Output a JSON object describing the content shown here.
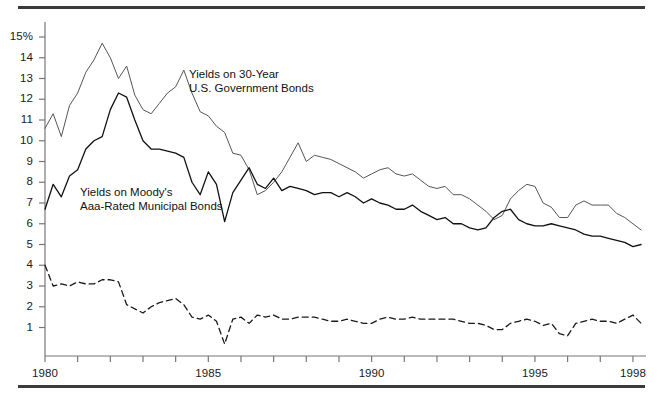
{
  "figure": {
    "background": "#ffffff",
    "top_rule_color": "#3a3a3a",
    "bottom_rule_color": "#3a3a3a"
  },
  "annotations": {
    "gov_line1": "Yields on 30-Year",
    "gov_line2": "U.S. Government Bonds",
    "muni_line1": "Yields on Moody's",
    "muni_line2": "Aaa-Rated Municipal Bonds"
  },
  "chart_data": {
    "type": "line",
    "title": "",
    "subtitle": "",
    "xlabel": "",
    "ylabel": "",
    "xlim": [
      1980.0,
      1998.4
    ],
    "ylim": [
      0,
      15.6
    ],
    "grid": false,
    "legend_position": "inline-annotations",
    "y_ticks": [
      1,
      2,
      3,
      4,
      5,
      6,
      7,
      8,
      9,
      10,
      11,
      12,
      13,
      14,
      15
    ],
    "y_tick_labels": [
      "1",
      "2",
      "3",
      "4",
      "5",
      "6",
      "7",
      "8",
      "9",
      "10",
      "11",
      "12",
      "13",
      "14",
      "15%"
    ],
    "x_ticks": [
      1980,
      1981,
      1982,
      1983,
      1984,
      1985,
      1986,
      1987,
      1988,
      1989,
      1990,
      1991,
      1992,
      1993,
      1994,
      1995,
      1996,
      1997,
      1998
    ],
    "x_tick_labels_shown": [
      "1980",
      "1985",
      "1990",
      "1995",
      "1998"
    ],
    "x_tick_label_values": [
      1980,
      1985,
      1990,
      1995,
      1998
    ],
    "series": [
      {
        "name": "Yields on 30-Year U.S. Government Bonds",
        "style": "solid",
        "color": "#555555",
        "width": 1.0,
        "x": [
          1980.0,
          1980.25,
          1980.5,
          1980.75,
          1981.0,
          1981.25,
          1981.5,
          1981.75,
          1982.0,
          1982.25,
          1982.5,
          1982.75,
          1983.0,
          1983.25,
          1983.5,
          1983.75,
          1984.0,
          1984.25,
          1984.5,
          1984.75,
          1985.0,
          1985.25,
          1985.5,
          1985.75,
          1986.0,
          1986.25,
          1986.5,
          1986.75,
          1987.0,
          1987.25,
          1987.5,
          1987.75,
          1988.0,
          1988.25,
          1988.5,
          1988.75,
          1989.0,
          1989.25,
          1989.5,
          1989.75,
          1990.0,
          1990.25,
          1990.5,
          1990.75,
          1991.0,
          1991.25,
          1991.5,
          1991.75,
          1992.0,
          1992.25,
          1992.5,
          1992.75,
          1993.0,
          1993.25,
          1993.5,
          1993.75,
          1994.0,
          1994.25,
          1994.5,
          1994.75,
          1995.0,
          1995.25,
          1995.5,
          1995.75,
          1996.0,
          1996.25,
          1996.5,
          1996.75,
          1997.0,
          1997.25,
          1997.5,
          1997.75,
          1998.0,
          1998.25
        ],
        "y": [
          10.6,
          11.3,
          10.2,
          11.7,
          12.3,
          13.3,
          13.9,
          14.7,
          14.0,
          13.0,
          13.6,
          12.2,
          11.5,
          11.3,
          11.8,
          12.3,
          12.6,
          13.4,
          12.3,
          11.4,
          11.2,
          10.7,
          10.4,
          9.4,
          9.3,
          8.6,
          7.4,
          7.6,
          8.0,
          8.5,
          9.2,
          9.9,
          9.0,
          9.3,
          9.2,
          9.1,
          8.9,
          8.7,
          8.5,
          8.2,
          8.4,
          8.6,
          8.7,
          8.4,
          8.3,
          8.4,
          8.1,
          7.8,
          7.7,
          7.8,
          7.4,
          7.4,
          7.2,
          6.9,
          6.6,
          6.2,
          6.4,
          7.2,
          7.6,
          7.9,
          7.8,
          7.0,
          6.8,
          6.3,
          6.3,
          6.9,
          7.1,
          6.9,
          6.9,
          6.9,
          6.5,
          6.3,
          6.0,
          5.7
        ],
        "y_right_end": 6.6
      },
      {
        "name": "Yields on Moody's Aaa-Rated Municipal Bonds",
        "style": "solid",
        "color": "#111111",
        "width": 1.3,
        "x": [
          1980.0,
          1980.25,
          1980.5,
          1980.75,
          1981.0,
          1981.25,
          1981.5,
          1981.75,
          1982.0,
          1982.25,
          1982.5,
          1982.75,
          1983.0,
          1983.25,
          1983.5,
          1983.75,
          1984.0,
          1984.25,
          1984.5,
          1984.75,
          1985.0,
          1985.25,
          1985.5,
          1985.75,
          1986.0,
          1986.25,
          1986.5,
          1986.75,
          1987.0,
          1987.25,
          1987.5,
          1987.75,
          1988.0,
          1988.25,
          1988.5,
          1988.75,
          1989.0,
          1989.25,
          1989.5,
          1989.75,
          1990.0,
          1990.25,
          1990.5,
          1990.75,
          1991.0,
          1991.25,
          1991.5,
          1991.75,
          1992.0,
          1992.25,
          1992.5,
          1992.75,
          1993.0,
          1993.25,
          1993.5,
          1993.75,
          1994.0,
          1994.25,
          1994.5,
          1994.75,
          1995.0,
          1995.25,
          1995.5,
          1995.75,
          1996.0,
          1996.25,
          1996.5,
          1996.75,
          1997.0,
          1997.25,
          1997.5,
          1997.75,
          1998.0,
          1998.25
        ],
        "y": [
          6.7,
          7.9,
          7.3,
          8.3,
          8.6,
          9.6,
          10.0,
          10.2,
          11.5,
          12.3,
          12.1,
          11.0,
          10.0,
          9.6,
          9.6,
          9.5,
          9.4,
          9.2,
          8.0,
          7.4,
          8.5,
          7.9,
          6.1,
          7.5,
          8.1,
          8.7,
          7.9,
          7.7,
          8.2,
          7.6,
          7.8,
          7.7,
          7.6,
          7.4,
          7.5,
          7.5,
          7.3,
          7.5,
          7.3,
          7.0,
          7.2,
          7.0,
          6.9,
          6.7,
          6.7,
          6.9,
          6.6,
          6.4,
          6.2,
          6.3,
          6.0,
          6.0,
          5.8,
          5.7,
          5.8,
          6.3,
          6.6,
          6.7,
          6.2,
          6.0,
          5.9,
          5.9,
          6.0,
          5.9,
          5.8,
          5.7,
          5.5,
          5.4,
          5.4,
          5.3,
          5.2,
          5.1,
          4.9,
          5.0
        ],
        "y_right_end": 5.0
      },
      {
        "name": "Spread",
        "style": "dashed",
        "color": "#1a1a1a",
        "width": 1.3,
        "x": [
          1980.0,
          1980.25,
          1980.5,
          1980.75,
          1981.0,
          1981.25,
          1981.5,
          1981.75,
          1982.0,
          1982.25,
          1982.5,
          1982.75,
          1983.0,
          1983.25,
          1983.5,
          1983.75,
          1984.0,
          1984.25,
          1984.5,
          1984.75,
          1985.0,
          1985.25,
          1985.5,
          1985.75,
          1986.0,
          1986.25,
          1986.5,
          1986.75,
          1987.0,
          1987.25,
          1987.5,
          1987.75,
          1988.0,
          1988.25,
          1988.5,
          1988.75,
          1989.0,
          1989.25,
          1989.5,
          1989.75,
          1990.0,
          1990.25,
          1990.5,
          1990.75,
          1991.0,
          1991.25,
          1991.5,
          1991.75,
          1992.0,
          1992.25,
          1992.5,
          1992.75,
          1993.0,
          1993.25,
          1993.5,
          1993.75,
          1994.0,
          1994.25,
          1994.5,
          1994.75,
          1995.0,
          1995.25,
          1995.5,
          1995.75,
          1996.0,
          1996.25,
          1996.5,
          1996.75,
          1997.0,
          1997.25,
          1997.5,
          1997.75,
          1998.0,
          1998.25
        ],
        "y": [
          4.0,
          3.0,
          3.1,
          3.0,
          3.2,
          3.1,
          3.1,
          3.3,
          3.3,
          3.2,
          2.1,
          1.9,
          1.7,
          2.0,
          2.2,
          2.3,
          2.4,
          2.1,
          1.5,
          1.4,
          1.6,
          1.3,
          0.2,
          1.4,
          1.5,
          1.2,
          1.6,
          1.5,
          1.6,
          1.4,
          1.4,
          1.5,
          1.5,
          1.5,
          1.4,
          1.3,
          1.3,
          1.4,
          1.3,
          1.2,
          1.2,
          1.4,
          1.5,
          1.4,
          1.4,
          1.5,
          1.4,
          1.4,
          1.4,
          1.4,
          1.4,
          1.3,
          1.2,
          1.2,
          1.1,
          0.9,
          0.9,
          1.2,
          1.3,
          1.4,
          1.3,
          1.1,
          1.2,
          0.7,
          0.6,
          1.2,
          1.3,
          1.4,
          1.3,
          1.3,
          1.2,
          1.4,
          1.6,
          1.2
        ],
        "y_right_end": 1.5
      }
    ]
  }
}
